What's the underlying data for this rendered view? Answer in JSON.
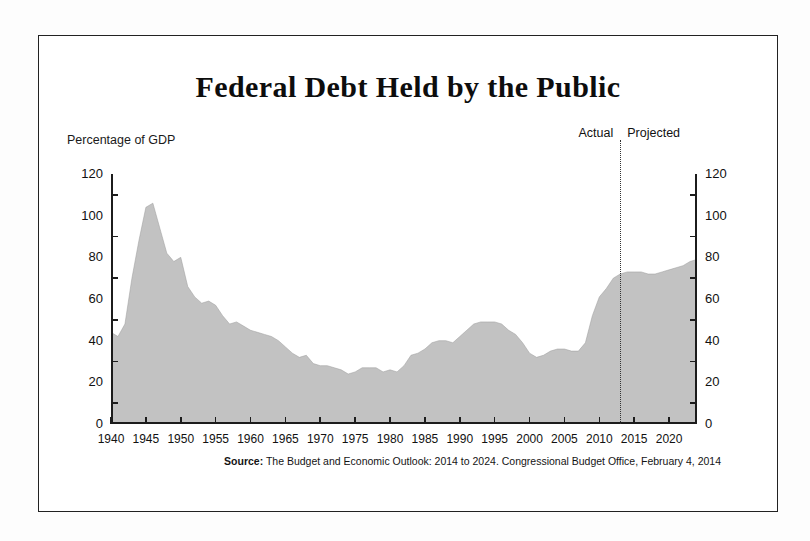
{
  "chart_data": {
    "type": "area",
    "title": "Federal Debt Held by the Public",
    "ylabel": "Percentage of GDP",
    "xlabel": "",
    "ylim": [
      0,
      120
    ],
    "xlim": [
      1940,
      2024
    ],
    "grid": false,
    "legend": "none",
    "y_ticks": [
      0,
      20,
      40,
      60,
      80,
      100,
      120
    ],
    "y_tick_labels": [
      "0",
      "20",
      "40",
      "60",
      "80",
      "100",
      "120"
    ],
    "y_tick_marks": [
      10,
      30,
      50,
      70,
      90,
      110
    ],
    "x_ticks": [
      1940,
      1945,
      1950,
      1955,
      1960,
      1965,
      1970,
      1975,
      1980,
      1985,
      1990,
      1995,
      2000,
      2005,
      2010,
      2015,
      2020
    ],
    "x_tick_labels": [
      "1940",
      "1945",
      "1950",
      "1955",
      "1960",
      "1965",
      "1970",
      "1975",
      "1980",
      "1985",
      "1990",
      "1995",
      "2000",
      "2005",
      "2010",
      "2015",
      "2020"
    ],
    "series_name": "Federal debt held by the public",
    "fill_color": "#c2c2c2",
    "annotations": {
      "divider_year": 2013,
      "actual_label": "Actual",
      "projected_label": "Projected"
    },
    "x": [
      1940,
      1941,
      1942,
      1943,
      1944,
      1945,
      1946,
      1947,
      1948,
      1949,
      1950,
      1951,
      1952,
      1953,
      1954,
      1955,
      1956,
      1957,
      1958,
      1959,
      1960,
      1961,
      1962,
      1963,
      1964,
      1965,
      1966,
      1967,
      1968,
      1969,
      1970,
      1971,
      1972,
      1973,
      1974,
      1975,
      1976,
      1977,
      1978,
      1979,
      1980,
      1981,
      1982,
      1983,
      1984,
      1985,
      1986,
      1987,
      1988,
      1989,
      1990,
      1991,
      1992,
      1993,
      1994,
      1995,
      1996,
      1997,
      1998,
      1999,
      2000,
      2001,
      2002,
      2003,
      2004,
      2005,
      2006,
      2007,
      2008,
      2009,
      2010,
      2011,
      2012,
      2013,
      2014,
      2015,
      2016,
      2017,
      2018,
      2019,
      2020,
      2021,
      2022,
      2023,
      2024
    ],
    "values": [
      44,
      42,
      48,
      70,
      88,
      104,
      106,
      94,
      82,
      78,
      80,
      66,
      61,
      58,
      59,
      57,
      52,
      48,
      49,
      47,
      45,
      44,
      43,
      42,
      40,
      37,
      34,
      32,
      33,
      29,
      28,
      28,
      27,
      26,
      24,
      25,
      27,
      27,
      27,
      25,
      26,
      25,
      28,
      33,
      34,
      36,
      39,
      40,
      40,
      39,
      42,
      45,
      48,
      49,
      49,
      49,
      48,
      45,
      43,
      39,
      34,
      32,
      33,
      35,
      36,
      36,
      35,
      35,
      39,
      52,
      61,
      65,
      70,
      72,
      73,
      73,
      73,
      72,
      72,
      73,
      74,
      75,
      76,
      78,
      79
    ]
  },
  "source": {
    "lead": "Source:",
    "text": "The Budget and Economic Outlook: 2014 to 2024. Congressional Budget Office, February 4, 2014"
  }
}
